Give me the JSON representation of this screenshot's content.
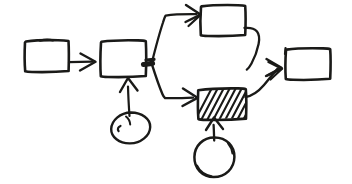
{
  "canvas": {
    "width": 352,
    "height": 184,
    "background_color": "#ffffff",
    "ink_color": "#1a1a18",
    "style": "hand-drawn-sketch",
    "title": ""
  },
  "diagram": {
    "kind": "flow-diagram",
    "node_count": 7,
    "edge_count": 7,
    "nodes": [
      {
        "id": "box-1",
        "type": "rectangle",
        "label": "",
        "fill": "none",
        "x": 25,
        "y": 40,
        "width": 44,
        "height": 32
      },
      {
        "id": "box-2",
        "type": "rectangle",
        "label": "",
        "fill": "none",
        "x": 100,
        "y": 40,
        "width": 46,
        "height": 37
      },
      {
        "id": "box-top",
        "type": "rectangle",
        "label": "",
        "fill": "none",
        "x": 200,
        "y": 5,
        "width": 45,
        "height": 31
      },
      {
        "id": "box-hatched",
        "type": "rectangle",
        "label": "",
        "fill": "diagonal-hatch",
        "x": 197,
        "y": 88,
        "width": 49,
        "height": 32
      },
      {
        "id": "box-right",
        "type": "rectangle",
        "label": "",
        "fill": "none",
        "x": 285,
        "y": 48,
        "width": 45,
        "height": 32
      },
      {
        "id": "ellipse-1",
        "type": "ellipse",
        "label": "",
        "fill": "none",
        "cx": 130,
        "cy": 128,
        "rx": 20,
        "ry": 16
      },
      {
        "id": "ellipse-2",
        "type": "ellipse",
        "label": "",
        "fill": "none",
        "cx": 214,
        "cy": 157,
        "rx": 20,
        "ry": 20
      }
    ],
    "edges": [
      {
        "id": "edge-box1-box2",
        "from": "box-1",
        "to": "box-2",
        "arrow": true,
        "route": "horizontal"
      },
      {
        "id": "edge-box2-junction",
        "from": "box-2",
        "to": "junction",
        "arrow": false,
        "route": "stub"
      },
      {
        "id": "edge-junction-boxtop",
        "from": "junction",
        "to": "box-top",
        "arrow": true,
        "route": "up-then-right"
      },
      {
        "id": "edge-junction-boxhatched",
        "from": "junction",
        "to": "box-hatched",
        "arrow": true,
        "route": "down-then-right"
      },
      {
        "id": "edge-boxtop-boxright",
        "from": "box-top",
        "to": "box-right",
        "arrow": true,
        "route": "curve-down"
      },
      {
        "id": "edge-boxhatched-boxright",
        "from": "box-hatched",
        "to": "box-right",
        "arrow": true,
        "route": "up-right"
      },
      {
        "id": "edge-ellipse1-box2",
        "from": "ellipse-1",
        "to": "box-2",
        "arrow": true,
        "route": "vertical-up"
      },
      {
        "id": "edge-ellipse2-boxhatched",
        "from": "ellipse-2",
        "to": "box-hatched",
        "arrow": true,
        "route": "vertical-up"
      }
    ],
    "junction": {
      "id": "junction",
      "x": 150,
      "y": 64
    }
  }
}
